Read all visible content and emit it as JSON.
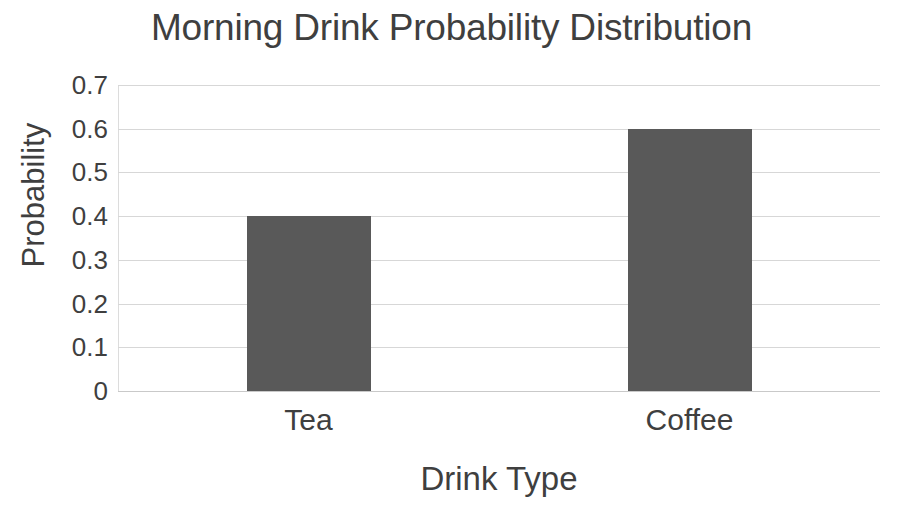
{
  "chart_data": {
    "type": "bar",
    "title": "Morning Drink Probability Distribution",
    "xlabel": "Drink Type",
    "ylabel": "Probability",
    "categories": [
      "Tea",
      "Coffee"
    ],
    "values": [
      0.4,
      0.6
    ],
    "ylim": [
      0,
      0.7
    ],
    "ytick_labels": [
      "0",
      "0.1",
      "0.2",
      "0.3",
      "0.4",
      "0.5",
      "0.6",
      "0.7"
    ],
    "ytick_values": [
      0,
      0.1,
      0.2,
      0.3,
      0.4,
      0.5,
      0.6,
      0.7
    ],
    "grid": true,
    "legend": false,
    "bar_color": "#595959",
    "grid_color": "#d7d7d7",
    "text_color": "#3f3f3f",
    "background_color": "#ffffff",
    "series": [
      {
        "name": "Probability",
        "values": [
          0.4,
          0.6
        ]
      }
    ]
  }
}
